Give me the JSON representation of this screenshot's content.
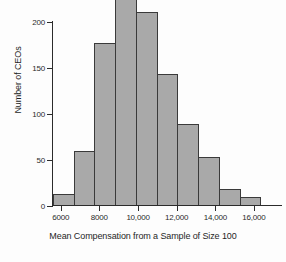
{
  "chart_data": {
    "type": "bar",
    "title": "",
    "subtitle": "",
    "xlabel": "Mean Compensation from a Sample of Size 100",
    "ylabel": "Number of CEOs",
    "grid": false,
    "legend": null,
    "xlim": [
      5600,
      17400
    ],
    "ylim": [
      0,
      232
    ],
    "bin_width": 1000,
    "bin_edges": [
      6000,
      7000,
      8000,
      9000,
      10000,
      11000,
      12000,
      13000,
      14000,
      15000,
      16000,
      17000
    ],
    "categories": [
      "6000-7000",
      "7000-8000",
      "8000-9000",
      "9000-10,000",
      "10,000-11,000",
      "11,000-12,000",
      "12,000-13,000",
      "13,000-14,000",
      "14,000-15,000",
      "15,000-16,000",
      "16,000-17,000"
    ],
    "values": [
      13,
      60,
      177,
      228,
      211,
      143,
      89,
      53,
      18,
      10,
      1
    ],
    "xticks": [
      6000,
      8000,
      10000,
      12000,
      14000,
      16000
    ],
    "xtick_labels": [
      "6000",
      "8000",
      "10,000",
      "12,000",
      "14,000",
      "16,000"
    ],
    "yticks": [
      0,
      50,
      100,
      150,
      200
    ],
    "ytick_labels": [
      "0",
      "50",
      "100",
      "150",
      "200"
    ],
    "bar_fill_color": "#a9a9a9",
    "bar_edge_color": "#3a3a3a",
    "axis_color": "#2b2b2b",
    "background_color": "#fdfdfd"
  }
}
